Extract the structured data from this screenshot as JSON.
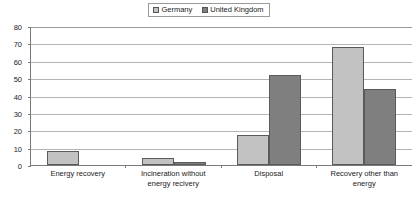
{
  "chart_data": {
    "type": "bar",
    "title": "",
    "subtitle": "",
    "xlabel": "",
    "ylabel": "",
    "ylim": [
      0,
      80
    ],
    "ytick_step": 10,
    "yticks": [
      80,
      70,
      60,
      50,
      40,
      30,
      20,
      10,
      0
    ],
    "grid": "horizontal",
    "legend_position": "top-center",
    "categories": [
      "Energy recovery",
      "Incineration without energy recivery",
      "Disposal",
      "Recovery other than energy"
    ],
    "category_lines": [
      [
        "Energy recovery"
      ],
      [
        "Incineration without",
        "energy recivery"
      ],
      [
        "Disposal"
      ],
      [
        "Recovery other than",
        "energy"
      ]
    ],
    "series": [
      {
        "name": "Germany",
        "color": "#c2c2c2",
        "values": [
          8,
          4,
          17.5,
          68
        ]
      },
      {
        "name": "United Kingdom",
        "color": "#7f7f7f",
        "values": [
          0,
          1.5,
          52,
          44
        ]
      }
    ]
  },
  "legend": {
    "entries": [
      {
        "label": "Germany",
        "swatch": "legend-swatch-germany"
      },
      {
        "label": "United Kingdom",
        "swatch": "legend-swatch-united-kingdom"
      }
    ]
  },
  "colors": {
    "series_germany": "#c2c2c2",
    "series_united_kingdom": "#7f7f7f",
    "gridline": "#b4b4b4",
    "axis": "#7a7a7a",
    "background": "#ffffff",
    "text": "#1a1a1a"
  }
}
